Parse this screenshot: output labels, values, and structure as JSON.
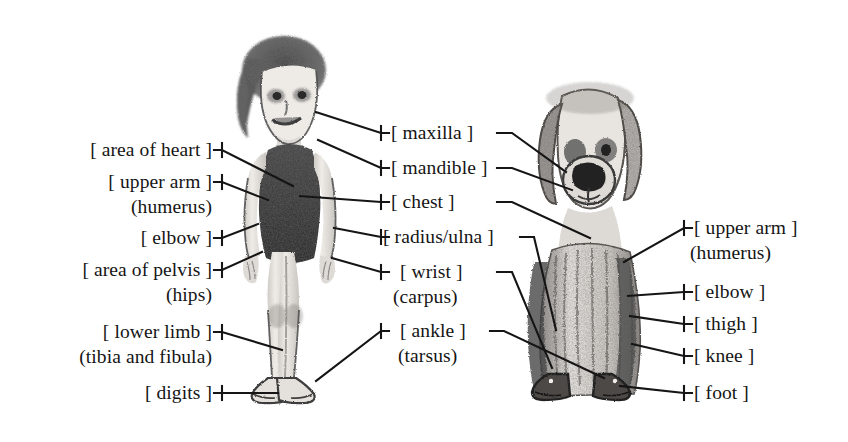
{
  "figure": {
    "type": "anatomy-comparison-diagram",
    "medium": "pencil sketch",
    "background_color": "#ffffff",
    "ink_color": "#151515",
    "subjects": [
      {
        "name": "child",
        "pose": "standing, front view",
        "position": "left-center"
      },
      {
        "name": "dog",
        "pose": "sitting, front view",
        "position": "right-center"
      }
    ]
  },
  "labels": {
    "left_column": [
      {
        "name": "area-of-heart",
        "text": "[ area of heart ]",
        "sub": ""
      },
      {
        "name": "upper-arm",
        "text": "[ upper arm ]",
        "sub": "(humerus)"
      },
      {
        "name": "elbow",
        "text": "[ elbow ]",
        "sub": ""
      },
      {
        "name": "area-of-pelvis",
        "text": "[ area of pelvis ]",
        "sub": "(hips)"
      },
      {
        "name": "lower-limb",
        "text": "[ lower limb ]",
        "sub": "(tibia and fibula)"
      },
      {
        "name": "digits",
        "text": "[ digits ]",
        "sub": ""
      }
    ],
    "center_column": [
      {
        "name": "maxilla",
        "text": "[ maxilla ]",
        "sub": ""
      },
      {
        "name": "mandible",
        "text": "[ mandible ]",
        "sub": ""
      },
      {
        "name": "chest",
        "text": "[ chest ]",
        "sub": ""
      },
      {
        "name": "radius-ulna",
        "text": "[ radius/ulna ]",
        "sub": ""
      },
      {
        "name": "wrist",
        "text": "[ wrist ]",
        "sub": "(carpus)"
      },
      {
        "name": "ankle",
        "text": "[ ankle ]",
        "sub": "(tarsus)"
      }
    ],
    "right_column": [
      {
        "name": "upper-arm",
        "text": "[ upper arm ]",
        "sub": "(humerus)"
      },
      {
        "name": "elbow",
        "text": "[ elbow ]",
        "sub": ""
      },
      {
        "name": "thigh",
        "text": "[ thigh ]",
        "sub": ""
      },
      {
        "name": "knee",
        "text": "[ knee ]",
        "sub": ""
      },
      {
        "name": "foot",
        "text": "[ foot ]",
        "sub": ""
      }
    ]
  }
}
